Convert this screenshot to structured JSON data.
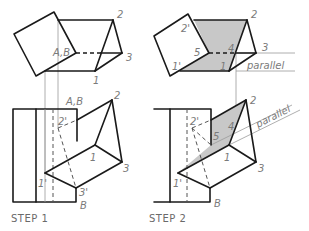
{
  "figure": {
    "type": "technical-drawing",
    "colors": {
      "line": "#1a1a1a",
      "construction": "#9a9a9a",
      "shade": "#c8c8c8",
      "label": "#7a7a7a"
    }
  },
  "step1": {
    "caption": "STEP 1",
    "top_view": {
      "labels": {
        "ab": "A,B",
        "p2": "2",
        "p3": "3",
        "p1": "1"
      }
    },
    "front_view": {
      "labels": {
        "ab": "A,B",
        "p2": "2",
        "p2prime": "2'",
        "p1": "1",
        "p3": "3",
        "p1prime": "1'",
        "p3prime": "3'",
        "b": "B"
      }
    }
  },
  "step2": {
    "caption": "STEP 2",
    "top_view": {
      "labels": {
        "p2prime": "2'",
        "p2": "2",
        "p5": "5",
        "p4": "4",
        "p3": "3",
        "p1prime": "1'",
        "p1": "1",
        "parallel": "parallel"
      }
    },
    "front_view": {
      "labels": {
        "p2": "2",
        "p2prime": "2'",
        "p5": "5",
        "p4": "4",
        "p1": "1",
        "p3": "3",
        "p1prime": "1'",
        "b": "B",
        "parallel": "parallel"
      }
    }
  }
}
